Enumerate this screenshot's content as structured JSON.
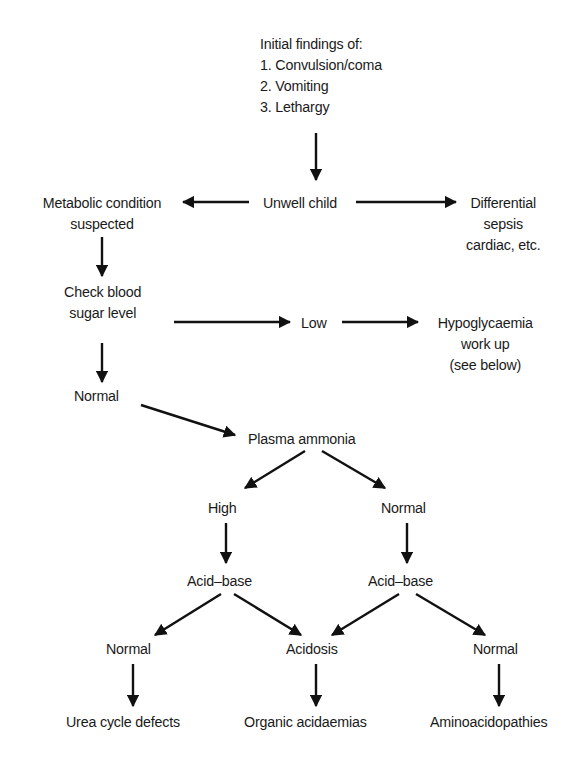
{
  "diagram": {
    "type": "flowchart",
    "nodes": {
      "initial_findings": {
        "title": "Initial findings of:",
        "items": [
          "1.  Convulsion/coma",
          "2.  Vomiting",
          "3.  Lethargy"
        ]
      },
      "unwell_child": "Unwell child",
      "metabolic": [
        "Metabolic condition",
        "suspected"
      ],
      "differential": [
        "Differential",
        "sepsis",
        "cardiac, etc."
      ],
      "check_sugar": [
        "Check blood",
        "sugar level"
      ],
      "low": "Low",
      "hypoglycaemia": [
        "Hypoglycaemia",
        "work up",
        "(see below)"
      ],
      "normal_sugar": "Normal",
      "plasma_ammonia": "Plasma ammonia",
      "high": "High",
      "normal_ammonia": "Normal",
      "acid_base_left": "Acid–base",
      "acid_base_right": "Acid–base",
      "normal_left": "Normal",
      "acidosis": "Acidosis",
      "normal_right": "Normal",
      "urea_cycle": "Urea cycle defects",
      "organic_acidaemias": "Organic acidaemias",
      "aminoacidopathies": "Aminoacidopathies"
    },
    "edges": [
      [
        "initial_findings",
        "unwell_child"
      ],
      [
        "unwell_child",
        "metabolic"
      ],
      [
        "unwell_child",
        "differential"
      ],
      [
        "metabolic",
        "check_sugar"
      ],
      [
        "check_sugar",
        "low"
      ],
      [
        "low",
        "hypoglycaemia"
      ],
      [
        "check_sugar",
        "normal_sugar"
      ],
      [
        "normal_sugar",
        "plasma_ammonia"
      ],
      [
        "plasma_ammonia",
        "high"
      ],
      [
        "plasma_ammonia",
        "normal_ammonia"
      ],
      [
        "high",
        "acid_base_left"
      ],
      [
        "normal_ammonia",
        "acid_base_right"
      ],
      [
        "acid_base_left",
        "normal_left"
      ],
      [
        "acid_base_left",
        "acidosis"
      ],
      [
        "acid_base_right",
        "acidosis"
      ],
      [
        "acid_base_right",
        "normal_right"
      ],
      [
        "normal_left",
        "urea_cycle"
      ],
      [
        "acidosis",
        "organic_acidaemias"
      ],
      [
        "normal_right",
        "aminoacidopathies"
      ]
    ]
  }
}
